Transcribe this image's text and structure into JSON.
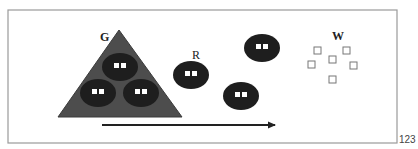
{
  "figure": {
    "number": "123",
    "frame": {
      "x": 8,
      "y": 10,
      "width": 389,
      "height": 133,
      "stroke": "#9a9a9a"
    },
    "colors": {
      "triangle": "#4d4d4d",
      "triangle_stroke": "#3a3a3a",
      "cell": "#1e1e1e",
      "cell_window": "#ffffff",
      "arrow": "#222222",
      "label": "#222222",
      "open_square": "#777777"
    }
  },
  "labels": {
    "group_g": "G",
    "group_r": "R",
    "group_w": "W"
  },
  "triangle": {
    "name": "G",
    "points": [
      [
        119,
        30
      ],
      [
        58,
        117
      ],
      [
        182,
        117
      ]
    ]
  },
  "cells": [
    {
      "id": "g-top",
      "group": "G",
      "cx": 120,
      "cy": 67,
      "rx": 18,
      "ry": 14
    },
    {
      "id": "g-bottom-left",
      "group": "G",
      "cx": 98,
      "cy": 93,
      "rx": 18,
      "ry": 14
    },
    {
      "id": "g-bottom-right",
      "group": "G",
      "cx": 141,
      "cy": 93,
      "rx": 18,
      "ry": 14
    },
    {
      "id": "r-1",
      "group": "R",
      "cx": 191,
      "cy": 75,
      "rx": 18,
      "ry": 14
    },
    {
      "id": "free-upper",
      "group": "free",
      "cx": 262,
      "cy": 48,
      "rx": 18,
      "ry": 14
    },
    {
      "id": "free-lower",
      "group": "free",
      "cx": 241,
      "cy": 96,
      "rx": 18,
      "ry": 14
    }
  ],
  "w_squares": [
    {
      "x": 314,
      "y": 47,
      "size": 7
    },
    {
      "x": 343,
      "y": 47,
      "size": 7
    },
    {
      "x": 308,
      "y": 61,
      "size": 7
    },
    {
      "x": 329,
      "y": 56,
      "size": 7
    },
    {
      "x": 350,
      "y": 62,
      "size": 7
    },
    {
      "x": 329,
      "y": 76,
      "size": 7
    }
  ],
  "arrow": {
    "x1": 102,
    "y1": 125,
    "x2": 281,
    "y2": 125
  }
}
